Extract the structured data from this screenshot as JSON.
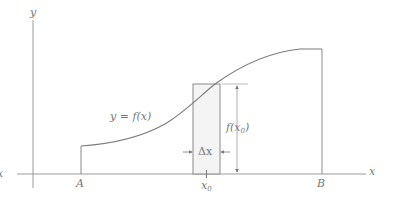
{
  "diagram": {
    "labels": {
      "y_axis": "y",
      "x_axis": "x",
      "x_axis_left": "x",
      "point_a": "A",
      "point_b": "B",
      "curve": "y = f(x)",
      "strip_width": "Δx",
      "strip_height_f": "f(x",
      "strip_height_sub": "0",
      "strip_height_close": ")",
      "x0": "x",
      "x0_sub": "0"
    },
    "colors": {
      "line": "#8a8a8a",
      "curve": "#7a7a7a",
      "strip_fill": "#f4f4f4",
      "text": "#777777"
    }
  }
}
